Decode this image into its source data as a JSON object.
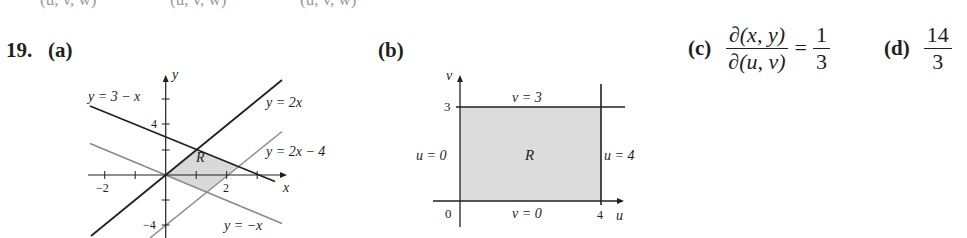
{
  "top_fragments": [
    "(u, v, w)",
    "(u, v, w)",
    "(u, v, w)"
  ],
  "problem": {
    "number": "19.",
    "parts": {
      "a": {
        "label": "(a)"
      },
      "b": {
        "label": "(b)"
      },
      "c": {
        "label": "(c)",
        "numerator": "∂(x, y)",
        "denominator": "∂(u, v)",
        "equals": "=",
        "value_num": "1",
        "value_den": "3"
      },
      "d": {
        "label": "(d)",
        "value_num": "14",
        "value_den": "3"
      }
    }
  },
  "graph_a": {
    "axis_x": "x",
    "axis_y": "y",
    "tick_labels": {
      "x_neg2": "−2",
      "x_2": "2",
      "y_4": "4",
      "y_neg4": "−4"
    },
    "region_label": "R",
    "lines": [
      {
        "label": "y = 3 − x",
        "slope": -1,
        "intercept": 3,
        "color": "#231f20"
      },
      {
        "label": "y = 2x",
        "slope": 2,
        "intercept": 0,
        "color": "#231f20"
      },
      {
        "label": "y = 2x − 4",
        "slope": 2,
        "intercept": -4,
        "color": "#8a8a8a"
      },
      {
        "label": "y = −x",
        "slope": -1,
        "intercept": 0,
        "color": "#8a8a8a"
      }
    ],
    "fill_color": "#d9d9d9"
  },
  "graph_b": {
    "axis_u": "u",
    "axis_v": "v",
    "tick_labels": {
      "origin": "0",
      "u_4": "4",
      "v_3": "3"
    },
    "region_label": "R",
    "boundary_labels": {
      "top": "v = 3",
      "bottom": "v = 0",
      "left": "u = 0",
      "right": "u = 4"
    },
    "fill_color": "#dcdcdc"
  }
}
